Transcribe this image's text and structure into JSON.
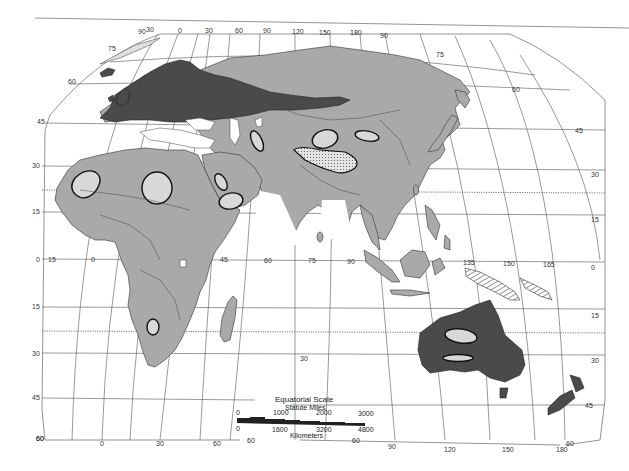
{
  "map": {
    "region": "Eastern Hemisphere (Europe, Africa, Asia, Australia)",
    "colors": {
      "background": "#ffffff",
      "land": "#a9a9a9",
      "dark_region": "#4a4a4a",
      "desert_ovals": "#d8d8d8",
      "grid": "#555555"
    },
    "longitude_labels_top": [
      "90",
      "30",
      "0",
      "30",
      "60",
      "90",
      "120",
      "150",
      "180",
      "90"
    ],
    "longitude_labels_equator": [
      "15",
      "0",
      "45",
      "60",
      "75",
      "90",
      "135",
      "150",
      "165"
    ],
    "longitude_labels_bottom_left": [
      "60",
      "0",
      "30",
      "60",
      "60"
    ],
    "longitude_labels_bottom_right": [
      "60",
      "90",
      "120",
      "150",
      "60",
      "180"
    ],
    "latitude_labels_left": [
      "75",
      "60",
      "45",
      "30",
      "15",
      "0",
      "15",
      "30",
      "45",
      "60"
    ],
    "latitude_labels_right": [
      "75",
      "60",
      "45",
      "30",
      "15",
      "0",
      "15",
      "30",
      "45"
    ],
    "interior_label": "30",
    "scale": {
      "title": "Equatorial Scale",
      "miles_label": "Statute Miles",
      "miles_ticks": [
        "0",
        "1000",
        "2000",
        "3000"
      ],
      "km_ticks": [
        "0",
        "1600",
        "3200",
        "4800"
      ],
      "km_label": "Kilometers"
    }
  }
}
